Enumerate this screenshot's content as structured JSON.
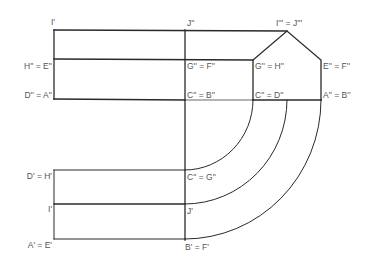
{
  "diagram": {
    "type": "orthographic development / projection drawing",
    "colors": {
      "line": "#2a2a2a",
      "label": "#555555",
      "background": "#ffffff"
    },
    "labels": {
      "i_prime_top": "I'",
      "j_dprime": "J''",
      "i_tprime_eq_j_tprime": "I''' = J'''",
      "h_dprime_eq_e_dprime": "H'' = E''",
      "g_dprime_eq_f_dprime": "G'' = F''",
      "g_dprime_eq_h_dprime": "G'' = H''",
      "e_dprime_eq_f_dprime": "E'' = F''",
      "d_dprime_eq_a_dprime": "D'' = A''",
      "c_dprime_eq_b_dprime": "C'' = B''",
      "c_dprime_eq_d_dprime": "C'' = D''",
      "a_dprime_eq_b_dprime": "A'' = B''",
      "d_prime_eq_h_prime": "D' = H'",
      "c_dprime_eq_g_dprime": "C'' = G''",
      "i_prime_bottom": "I'",
      "j_prime": "J'",
      "a_prime_eq_e_prime": "A' = E'",
      "b_prime_eq_f_prime": "B' = F'"
    }
  }
}
